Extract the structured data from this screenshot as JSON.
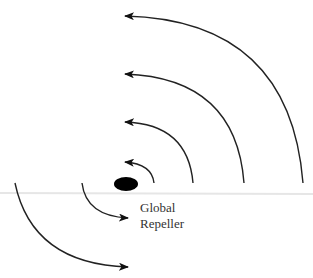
{
  "diagram": {
    "title": "",
    "colors": {
      "stroke": "#222222",
      "repeller": "#000000",
      "baseline": "#e6e6e6",
      "text": "#333333"
    },
    "repeller": {
      "label_line1": "Global",
      "label_line2": "Repeller",
      "cx": 126,
      "cy": 184,
      "rx": 12,
      "ry": 7
    },
    "baseline_y": 193,
    "upper_arcs": [
      {
        "name": "arc-1",
        "start": [
          154,
          183
        ],
        "tip": [
          124,
          162
        ]
      },
      {
        "name": "arc-2",
        "start": [
          193,
          183
        ],
        "tip": [
          124,
          122
        ]
      },
      {
        "name": "arc-3",
        "start": [
          244,
          183
        ],
        "tip": [
          124,
          74
        ]
      },
      {
        "name": "arc-4",
        "start": [
          303,
          183
        ],
        "tip": [
          124,
          16
        ]
      }
    ],
    "lower_arcs": [
      {
        "name": "arc-5",
        "start": [
          82,
          183
        ],
        "tip": [
          128,
          218
        ]
      },
      {
        "name": "arc-6",
        "start": [
          15,
          183
        ],
        "tip": [
          128,
          267
        ]
      }
    ]
  }
}
